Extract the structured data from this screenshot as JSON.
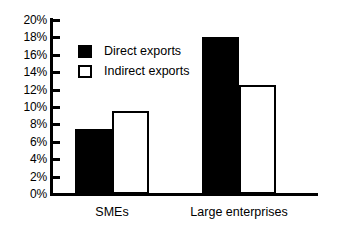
{
  "chart_data": {
    "type": "bar",
    "title": "",
    "xlabel": "",
    "ylabel": "",
    "ylim": [
      0,
      20
    ],
    "grid": false,
    "legend_position": "inside-top-left",
    "y_tick_labels": [
      "20%",
      "18%",
      "16%",
      "14%",
      "12%",
      "10%",
      "8%",
      "6%",
      "4%",
      "2%",
      "0%"
    ],
    "y_tick_values": [
      20,
      18,
      16,
      14,
      12,
      10,
      8,
      6,
      4,
      2,
      0
    ],
    "categories": [
      "SMEs",
      "Large enterprises"
    ],
    "series": [
      {
        "name": "Direct exports",
        "values": [
          7.5,
          18.1
        ],
        "fill": "#000000",
        "stroke": "#000000"
      },
      {
        "name": "Indirect exports",
        "values": [
          9.5,
          12.5
        ],
        "fill": "#ffffff",
        "stroke": "#000000"
      }
    ]
  },
  "legend": {
    "items": [
      {
        "label": "Direct exports",
        "swatch": "filled-square-icon"
      },
      {
        "label": "Indirect exports",
        "swatch": "hollow-square-icon"
      }
    ]
  }
}
